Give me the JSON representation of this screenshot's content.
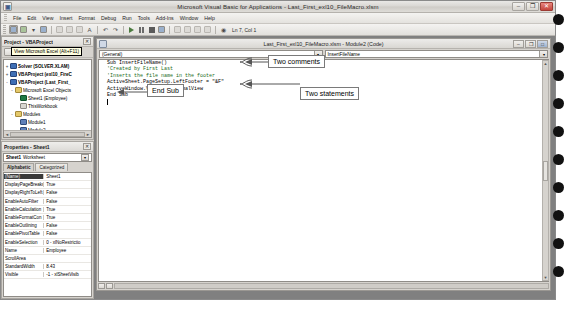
{
  "window": {
    "title": "Microsoft Visual Basic for Applications - Last_First_exl10_FileMacro.xlsm",
    "app_icon": "vba-icon",
    "minimize": "–",
    "restore": "❐",
    "close": "✕"
  },
  "menubar": {
    "items": [
      {
        "label": "File"
      },
      {
        "label": "Edit"
      },
      {
        "label": "View"
      },
      {
        "label": "Insert"
      },
      {
        "label": "Format"
      },
      {
        "label": "Debug"
      },
      {
        "label": "Run"
      },
      {
        "label": "Tools"
      },
      {
        "label": "Add-Ins"
      },
      {
        "label": "Window"
      },
      {
        "label": "Help"
      }
    ]
  },
  "toolbar": {
    "position_indicator": "Ln 7, Col 1",
    "buttons": [
      {
        "name": "view-excel-button",
        "glyph": "▣"
      },
      {
        "name": "insert-userform-button",
        "glyph": "▤"
      },
      {
        "name": "save-button",
        "glyph": "▦"
      },
      {
        "name": "cut-button",
        "glyph": "✂"
      },
      {
        "name": "copy-button",
        "glyph": "⧉"
      },
      {
        "name": "paste-button",
        "glyph": "📋"
      },
      {
        "name": "find-button",
        "glyph": "A"
      },
      {
        "name": "undo-button",
        "glyph": "↺"
      },
      {
        "name": "redo-button",
        "glyph": "↻"
      },
      {
        "name": "run-button",
        "glyph": "▶"
      },
      {
        "name": "break-button",
        "glyph": "❙❙"
      },
      {
        "name": "reset-button",
        "glyph": "■"
      },
      {
        "name": "design-mode-button",
        "glyph": "◨"
      },
      {
        "name": "project-explorer-button",
        "glyph": "▥"
      },
      {
        "name": "properties-window-button",
        "glyph": "☰"
      },
      {
        "name": "object-browser-button",
        "glyph": "⚇"
      },
      {
        "name": "toolbox-button",
        "glyph": "⚒"
      },
      {
        "name": "help-button",
        "glyph": "?"
      }
    ]
  },
  "tooltip": {
    "text": "View Microsoft Excel (Alt+F11)"
  },
  "project_explorer": {
    "title": "Project - VBAProject",
    "close_label": "✕",
    "toolbar_buttons": [
      {
        "name": "view-code-button"
      },
      {
        "name": "view-object-button"
      },
      {
        "name": "toggle-folders-button"
      }
    ],
    "tree": [
      {
        "indent": 0,
        "expander": "+",
        "icon": "vbaproject-icon",
        "label": "Solver (SOLVER.XLAM)",
        "bold": true
      },
      {
        "indent": 0,
        "expander": "+",
        "icon": "vbaproject-icon",
        "label": "VBAProject (exl10_FireC",
        "bold": true
      },
      {
        "indent": 0,
        "expander": "-",
        "icon": "vbaproject-icon",
        "label": "VBAProject (Last_First_",
        "bold": true
      },
      {
        "indent": 1,
        "expander": "-",
        "icon": "folder-icon",
        "label": "Microsoft Excel Objects",
        "bold": false
      },
      {
        "indent": 2,
        "expander": "",
        "icon": "sheet-icon",
        "label": "Sheet1 (Employee)",
        "bold": false
      },
      {
        "indent": 2,
        "expander": "",
        "icon": "workbook-icon",
        "label": "ThisWorkbook",
        "bold": false
      },
      {
        "indent": 1,
        "expander": "-",
        "icon": "folder-icon",
        "label": "Modules",
        "bold": false
      },
      {
        "indent": 2,
        "expander": "",
        "icon": "module-icon",
        "label": "Module1",
        "bold": false
      },
      {
        "indent": 2,
        "expander": "",
        "icon": "module-icon",
        "label": "Module2",
        "bold": false
      }
    ],
    "hscroll": {
      "left_arrow": "◄",
      "right_arrow": "►"
    }
  },
  "properties": {
    "title": "Properties - Sheet1",
    "close_label": "✕",
    "object_name": "Sheet1",
    "object_type": "Worksheet",
    "combo_arrow": "▾",
    "tabs": [
      {
        "label": "Alphabetic",
        "active": true
      },
      {
        "label": "Categorized",
        "active": false
      }
    ],
    "rows": [
      {
        "key": "(Name)",
        "value": "Sheet1",
        "selected": true
      },
      {
        "key": "DisplayPageBreaks",
        "value": "True",
        "selected": false
      },
      {
        "key": "DisplayRightToLeft",
        "value": "False",
        "selected": false
      },
      {
        "key": "EnableAutoFilter",
        "value": "False",
        "selected": false
      },
      {
        "key": "EnableCalculation",
        "value": "True",
        "selected": false
      },
      {
        "key": "EnableFormatCon",
        "value": "True",
        "selected": false
      },
      {
        "key": "EnableOutlining",
        "value": "False",
        "selected": false
      },
      {
        "key": "EnablePivotTable",
        "value": "False",
        "selected": false
      },
      {
        "key": "EnableSelection",
        "value": "0 - xlNoRestrictio",
        "selected": false
      },
      {
        "key": "Name",
        "value": "Employee",
        "selected": false
      },
      {
        "key": "ScrollArea",
        "value": "",
        "selected": false
      },
      {
        "key": "StandardWidth",
        "value": "8.43",
        "selected": false
      },
      {
        "key": "Visible",
        "value": "-1 - xlSheetVisib",
        "selected": false
      }
    ]
  },
  "code_window": {
    "title": "Last_First_exl10_FileMacro.xlsm - Module2 (Code)",
    "minimize": "–",
    "restore": "❐",
    "maximize": "□",
    "object_combo": "(General)",
    "proc_combo": "InsertFileName",
    "combo_arrow": "▾",
    "lines": [
      {
        "text": "Sub InsertFileName()",
        "comment": false
      },
      {
        "text": "'Created by First Last",
        "comment": true
      },
      {
        "text": "'Inserts the file name in the footer",
        "comment": true
      },
      {
        "text": "ActiveSheet.PageSetup.LeftFooter = \"&F\"",
        "comment": false
      },
      {
        "text": "ActiveWindow.View = xlNormalView",
        "comment": false
      },
      {
        "text": "End Sub",
        "comment": false
      }
    ],
    "vscroll": {
      "up": "▲",
      "down": "▼"
    }
  },
  "annotations": [
    {
      "name": "annotation-two-comments",
      "label": "Two comments"
    },
    {
      "name": "annotation-two-statements",
      "label": "Two statements"
    },
    {
      "name": "annotation-end-sub",
      "label": "End Sub"
    }
  ],
  "colors": {
    "window_face": "#d6d3ce",
    "workspace": "#808080",
    "comment_green": "#1b6b1b",
    "selection": "#3a3a3a",
    "callout_border": "#7a7a7a"
  }
}
